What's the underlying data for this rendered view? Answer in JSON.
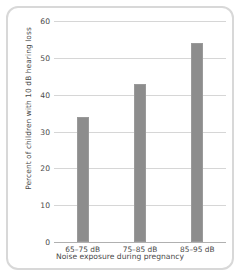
{
  "chart_data": {
    "type": "bar",
    "title": "",
    "categories": [
      "65–75 dB",
      "75–85 dB",
      "85–95 dB"
    ],
    "values": [
      34,
      43,
      54
    ],
    "xlabel": "Noise exposure during pregnancy",
    "ylabel": "Percent of children with 10 dB hearing loss",
    "ylim": [
      0,
      60
    ],
    "yticks": [
      0,
      10,
      20,
      30,
      40,
      50,
      60
    ],
    "ytick_labels": [
      "0",
      "10",
      "20",
      "30",
      "40",
      "50",
      "60"
    ],
    "grid": true,
    "legend": false,
    "legend_position": "none",
    "bar_color": "#8d8d8d",
    "grid_color": "#d6d6d6",
    "axis_color": "#b0b0b0",
    "frame_color": "#d8d8d8",
    "text_color": "#4a4a4a"
  }
}
